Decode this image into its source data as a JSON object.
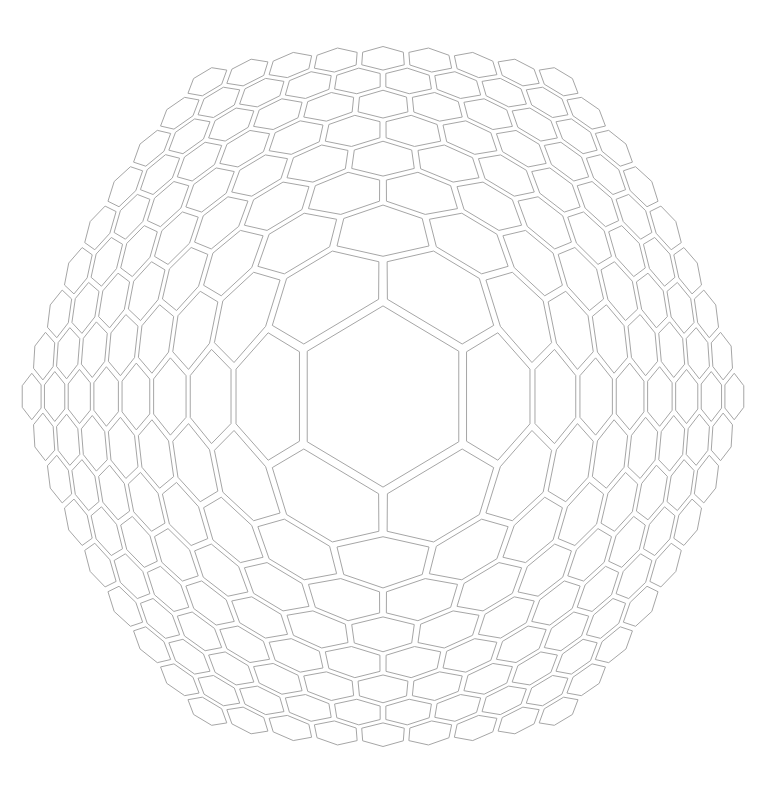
{
  "canvas": {
    "width": 778,
    "height": 786,
    "background": "#ffffff"
  },
  "pattern": {
    "type": "radially-distorted-hexagonal-grid",
    "cell_orientation": "pointy-top",
    "grid_radius_rings": 8,
    "cell_count": 217,
    "center": {
      "x": 383,
      "y": 396.5
    },
    "distortion": {
      "scale": 123.3,
      "exponent": 0.504,
      "y_scale": 1.035
    },
    "inset": {
      "base_px": 1.8,
      "proportional": 0.045
    },
    "stroke_color": "#a6a6a6",
    "stroke_width": 1,
    "fill_color": "#ffffff",
    "center_cell": {
      "top_vertex": [
        384,
        302
      ],
      "bottom_vertex": [
        384,
        492
      ],
      "left_edge_x": 303,
      "right_edge_x": 465
    },
    "bounds": {
      "left": 20,
      "right": 745,
      "top": 45,
      "bottom": 748
    }
  }
}
